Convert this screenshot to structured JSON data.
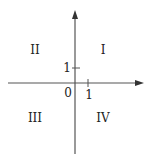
{
  "diagram": {
    "title": "",
    "origin_label": "0",
    "x_tick_label": "1",
    "y_tick_label": "1",
    "quadrants": {
      "I": "I",
      "II": "II",
      "III": "III",
      "IV": "IV"
    },
    "colors": {
      "axis": "#555555",
      "text": "#222222",
      "background": "#ffffff"
    }
  }
}
